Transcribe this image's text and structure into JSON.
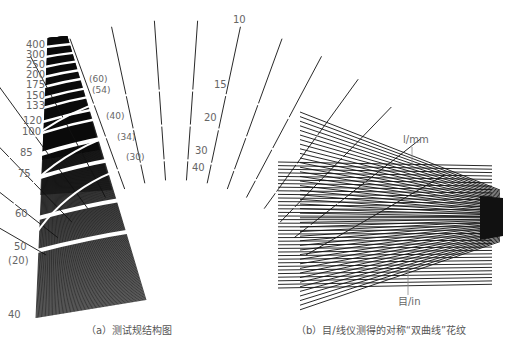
{
  "panel_a": {
    "caption": "（a）测试规结构图",
    "lpi_labels": [
      "400",
      "300",
      "250",
      "200",
      "175",
      "150",
      "133",
      "120",
      "100",
      "85",
      "75",
      "60",
      "50",
      "(20)",
      "40"
    ],
    "lpmm_paren_labels": [
      "(60)",
      "(54)",
      "(40)",
      "(34)",
      "(30)"
    ],
    "fan_labels": [
      "10",
      "15",
      "20",
      "30",
      "40"
    ]
  },
  "panel_b": {
    "caption": "（b）目/线仪测得的对称“双曲线”花纹",
    "label_top": "l/mm",
    "label_bottom": "目/in"
  },
  "colors": {
    "ink": "#111111",
    "label": "#666666",
    "background": "#ffffff"
  }
}
